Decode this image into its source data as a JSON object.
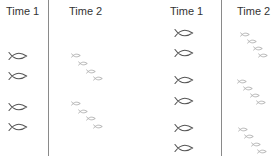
{
  "panels": [
    {
      "name": "left",
      "time1_label": "Time 1",
      "time2_label": "Time 2",
      "divider_x": 48,
      "big_fish": [
        {
          "x": 18,
          "y": 56
        },
        {
          "x": 18,
          "y": 76
        },
        {
          "x": 18,
          "y": 107
        },
        {
          "x": 18,
          "y": 127
        }
      ],
      "small_fish": [
        {
          "x": 76,
          "y": 55
        },
        {
          "x": 83,
          "y": 63
        },
        {
          "x": 91,
          "y": 71
        },
        {
          "x": 98,
          "y": 78
        },
        {
          "x": 76,
          "y": 103
        },
        {
          "x": 83,
          "y": 111
        },
        {
          "x": 91,
          "y": 118
        },
        {
          "x": 98,
          "y": 126
        }
      ]
    },
    {
      "name": "right",
      "time1_label": "Time 1",
      "time2_label": "Time 2",
      "divider_x": 221,
      "big_fish": [
        {
          "x": 184,
          "y": 33
        },
        {
          "x": 184,
          "y": 53
        },
        {
          "x": 184,
          "y": 80
        },
        {
          "x": 184,
          "y": 101
        },
        {
          "x": 184,
          "y": 128
        },
        {
          "x": 184,
          "y": 148
        }
      ],
      "small_fish": [
        {
          "x": 245,
          "y": 34
        },
        {
          "x": 252,
          "y": 41
        },
        {
          "x": 258,
          "y": 48
        },
        {
          "x": 263,
          "y": 55
        },
        {
          "x": 242,
          "y": 81
        },
        {
          "x": 248,
          "y": 88
        },
        {
          "x": 255,
          "y": 95
        },
        {
          "x": 261,
          "y": 102
        },
        {
          "x": 243,
          "y": 129
        },
        {
          "x": 249,
          "y": 136
        },
        {
          "x": 256,
          "y": 144
        },
        {
          "x": 262,
          "y": 151
        }
      ]
    }
  ],
  "colors": {
    "big_fish": "#555555",
    "small_fish": "#9a9a9a",
    "divider": "#8a8a8a",
    "text": "#333333"
  }
}
